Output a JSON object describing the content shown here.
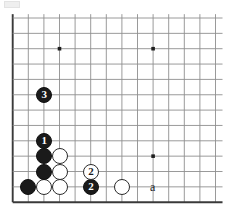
{
  "figure": {
    "kind": "go-board-diagram",
    "board": {
      "columns": 14,
      "rows": 13,
      "origin_x": 12.7,
      "origin_y": 18.0,
      "spacing_x": 15.6,
      "spacing_y": 15.35,
      "line_color": "#8f8f8f",
      "border_color": "#3a3a3a",
      "background_color": "#ffffff",
      "edges": {
        "left": true,
        "bottom": true,
        "top": false,
        "right": false
      }
    },
    "star_points": [
      {
        "col": 3,
        "row": 2,
        "name": "star-point-upper-left"
      },
      {
        "col": 9,
        "row": 2,
        "name": "star-point-upper-right"
      },
      {
        "col": 9,
        "row": 9,
        "name": "star-point-lower-right"
      }
    ],
    "stones": [
      {
        "id": "w-c3r9",
        "color": "white",
        "col": 3,
        "row": 9,
        "label": ""
      },
      {
        "id": "w-c3r10",
        "color": "white",
        "col": 3,
        "row": 10,
        "label": ""
      },
      {
        "id": "w-c3r11",
        "color": "white",
        "col": 3,
        "row": 11,
        "label": ""
      },
      {
        "id": "w-c2r11",
        "color": "white",
        "col": 2,
        "row": 11,
        "label": ""
      },
      {
        "id": "w-c7r11",
        "color": "white",
        "col": 7,
        "row": 11,
        "label": ""
      },
      {
        "id": "b-c2r8",
        "color": "black",
        "col": 2,
        "row": 8,
        "label": "1"
      },
      {
        "id": "b-c2r9",
        "color": "black",
        "col": 2,
        "row": 9,
        "label": ""
      },
      {
        "id": "b-c2r10",
        "color": "black",
        "col": 2,
        "row": 10,
        "label": ""
      },
      {
        "id": "b-c1r11",
        "color": "black",
        "col": 1,
        "row": 11,
        "label": ""
      },
      {
        "id": "b-c5r11",
        "color": "black",
        "col": 5,
        "row": 11,
        "label": "2"
      },
      {
        "id": "b-c2r5",
        "color": "black",
        "col": 2,
        "row": 5,
        "label": "3"
      }
    ],
    "move_markers": [
      {
        "id": "m2",
        "shape": "circle-outline",
        "col": 5,
        "row": 10,
        "label": "2"
      }
    ],
    "point_labels": [
      {
        "id": "label-a",
        "text": "a",
        "col": 9,
        "row": 11
      }
    ],
    "stone_radius": 8.0
  }
}
